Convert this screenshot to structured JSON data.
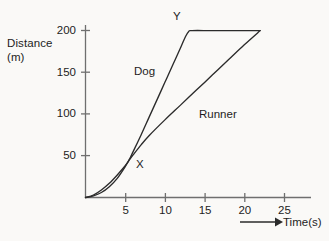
{
  "chart_data": {
    "type": "line",
    "title": "",
    "subtitle": "",
    "xlabel": "Time(s)",
    "ylabel": "Distance",
    "ylabel_units": "(m)",
    "xlim": [
      0,
      28
    ],
    "ylim": [
      0,
      215
    ],
    "xticks": [
      5,
      10,
      15,
      20,
      25
    ],
    "xtick_labels": [
      "5",
      "10",
      "15",
      "20",
      "25"
    ],
    "yticks": [
      50,
      100,
      150,
      200
    ],
    "ytick_labels": [
      "50",
      "100",
      "150",
      "200"
    ],
    "grid": false,
    "legend_position": "inline-annotations",
    "line_color": "#2b2b2b",
    "axis_color": "#6f6f6f",
    "background_color": "#faf9f7",
    "series": [
      {
        "name": "Dog",
        "label": "Dog",
        "points": [
          {
            "x": 0,
            "y": 0
          },
          {
            "x": 1,
            "y": 2
          },
          {
            "x": 2,
            "y": 6
          },
          {
            "x": 3,
            "y": 13
          },
          {
            "x": 4,
            "y": 23
          },
          {
            "x": 5,
            "y": 37
          },
          {
            "x": 5.6,
            "y": 47
          },
          {
            "x": 6,
            "y": 55
          },
          {
            "x": 7,
            "y": 75
          },
          {
            "x": 8,
            "y": 96
          },
          {
            "x": 9,
            "y": 117
          },
          {
            "x": 10,
            "y": 138
          },
          {
            "x": 11,
            "y": 159
          },
          {
            "x": 12,
            "y": 180
          },
          {
            "x": 12.6,
            "y": 193
          },
          {
            "x": 13,
            "y": 199
          },
          {
            "x": 13.4,
            "y": 200
          },
          {
            "x": 16,
            "y": 200
          },
          {
            "x": 20,
            "y": 200
          },
          {
            "x": 22,
            "y": 200
          }
        ]
      },
      {
        "name": "Runner",
        "label": "Runner",
        "points": [
          {
            "x": 0,
            "y": 0
          },
          {
            "x": 1,
            "y": 3
          },
          {
            "x": 2,
            "y": 9
          },
          {
            "x": 3,
            "y": 17
          },
          {
            "x": 4,
            "y": 27
          },
          {
            "x": 5,
            "y": 38
          },
          {
            "x": 5.6,
            "y": 46
          },
          {
            "x": 6,
            "y": 51
          },
          {
            "x": 7,
            "y": 63
          },
          {
            "x": 8,
            "y": 74
          },
          {
            "x": 10,
            "y": 93
          },
          {
            "x": 12,
            "y": 111
          },
          {
            "x": 14,
            "y": 129
          },
          {
            "x": 16,
            "y": 147
          },
          {
            "x": 18,
            "y": 165
          },
          {
            "x": 20,
            "y": 183
          },
          {
            "x": 22,
            "y": 200
          }
        ]
      }
    ],
    "annotations": [
      {
        "name": "X",
        "label": "X",
        "x": 5.6,
        "y": 47,
        "note": "crossing point of Dog and Runner"
      },
      {
        "name": "Y",
        "label": "Y",
        "x": 13.4,
        "y": 200,
        "note": "point where Dog reaches 200 m and stops"
      }
    ],
    "axis_arrow": {
      "label": "Time(s)",
      "direction": "right"
    }
  }
}
